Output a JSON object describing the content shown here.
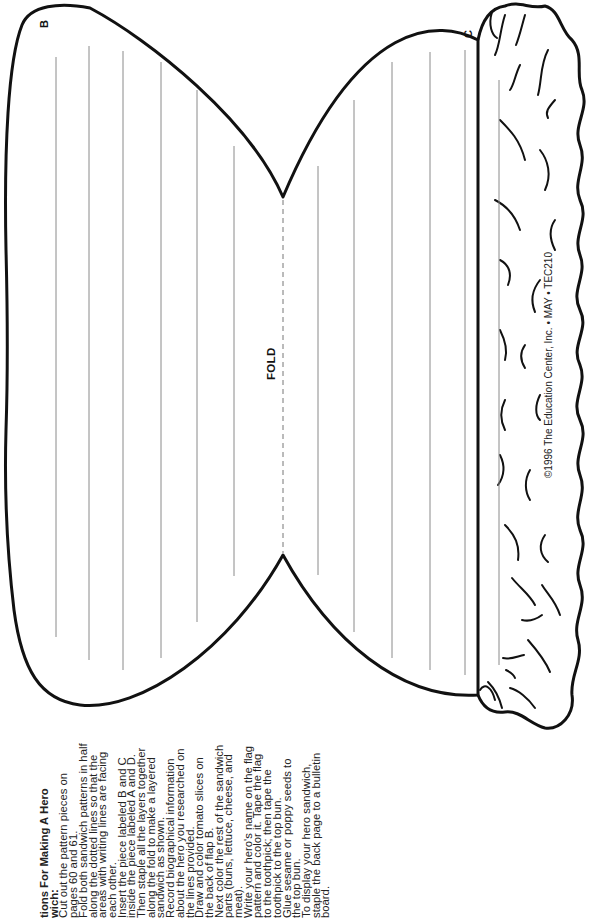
{
  "document": {
    "labels": {
      "flap_b": "B",
      "flap_c": "C",
      "fold": "FOLD"
    },
    "copyright": "©1996 The Education Center, Inc. • MAY • TEC210",
    "instructions": {
      "title_line1": "tions For Making A Hero",
      "title_line2": "wich:",
      "lines": [
        "Cut out the pattern pieces on",
        "pages 60 and 61.",
        "Fold both sandwich patterns in half",
        "along the dotted lines so that the",
        "areas with writing lines are facing",
        "each other.",
        "Insert the piece labeled B and C",
        "inside the piece labeled A and D.",
        "Then staple all the layers together",
        "along the fold to make a layered",
        "sandwich as shown.",
        "Record biographical information",
        "about the hero you researched on",
        "the lines provided.",
        "Draw and color tomato slices on",
        "the back of flap B.",
        "Next color the rest of the sandwich",
        "parts (buns, lettuce, cheese, and",
        "meat).",
        "Write your hero's name on the flag",
        "pattern and color it. Tape the flag",
        "to the toothpick; then tape the",
        "toothpick to the top bun.",
        "Glue sesame or poppy seeds to",
        "the top bun.",
        "To display your hero sandwich,",
        "staple the back page to a bulletin",
        "board."
      ]
    },
    "writing_lines": {
      "left_half_x": [
        56,
        89,
        123,
        161,
        197,
        234
      ],
      "right_half_x": [
        318,
        354,
        392,
        430,
        465,
        499
      ]
    },
    "colors": {
      "ink": "#111111",
      "rule": "#8a8a8a",
      "paper": "#ffffff"
    }
  }
}
